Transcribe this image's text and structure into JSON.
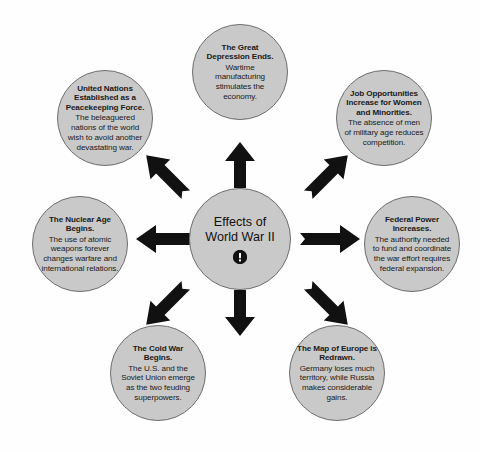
{
  "diagram": {
    "type": "hub-and-spoke-concept-map",
    "center": {
      "title": "Effects of World War II",
      "icon": "exclamation-circle-icon"
    },
    "nodes": [
      {
        "id": "great-depression",
        "position": "top",
        "title": "The Great Depression Ends.",
        "description": "Wartime manufacturing stimulates the economy."
      },
      {
        "id": "job-opportunities",
        "position": "top-right",
        "title": "Job Opportunities Increase for Women and Minorities.",
        "description": "The absence of men of military age reduces competition."
      },
      {
        "id": "federal-power",
        "position": "right",
        "title": "Federal Power Increases.",
        "description": "The authority needed to fund and coordinate the war effort requires federal expansion."
      },
      {
        "id": "map-europe",
        "position": "bottom-right",
        "title": "The Map of Europe is Redrawn.",
        "description": "Germany loses much territory, while Russia makes considerable gains."
      },
      {
        "id": "cold-war",
        "position": "bottom-left",
        "title": "The Cold War Begins.",
        "description": "The U.S. and the Soviet Union emerge as the two feuding superpowers."
      },
      {
        "id": "nuclear-age",
        "position": "left",
        "title": "The Nuclear Age Begins.",
        "description": "The use of atomic weapons forever changes warfare and international relations."
      },
      {
        "id": "united-nations",
        "position": "top-left",
        "title": "United Nations Established as a Peacekeeping Force.",
        "description": "The beleaguered nations of the world wish to avoid another devastating war."
      }
    ],
    "arrows": [
      {
        "id": "arrow-up",
        "direction": "up"
      },
      {
        "id": "arrow-up-right",
        "direction": "up-right"
      },
      {
        "id": "arrow-right",
        "direction": "right"
      },
      {
        "id": "arrow-down-right",
        "direction": "down-right"
      },
      {
        "id": "arrow-down",
        "direction": "down"
      },
      {
        "id": "arrow-down-left",
        "direction": "down-left"
      },
      {
        "id": "arrow-left",
        "direction": "left"
      },
      {
        "id": "arrow-up-left",
        "direction": "up-left"
      }
    ],
    "colors": {
      "circle_fill": "#c9c9c9",
      "circle_border": "#6e6e6e",
      "arrow_fill": "#111111",
      "text": "#1a1a1a",
      "background": "#ffffff"
    }
  }
}
